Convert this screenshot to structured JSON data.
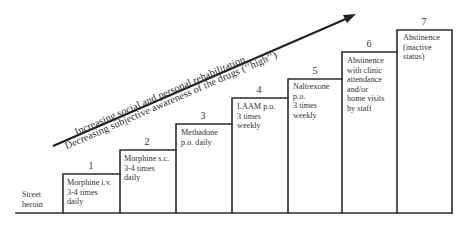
{
  "diagram": {
    "type": "staircase",
    "start_label": "Street\nheroin",
    "arrow": {
      "line1": "Increasing social and personal rehabilitation",
      "line2": "Decreasing subjective awareness of the drugs (‘‘high’’)"
    },
    "steps": [
      {
        "number": "1",
        "label": "Morphine i.v.\n3-4 times\ndaily"
      },
      {
        "number": "2",
        "label": "Morphine s.c.\n3-4 times\ndaily"
      },
      {
        "number": "3",
        "label": "Methadone\np.o. daily"
      },
      {
        "number": "4",
        "label": "LAAM p.o.\n3 times\nweekly"
      },
      {
        "number": "5",
        "label": "Naltrexone\np.o.\n3 times\nweekly"
      },
      {
        "number": "6",
        "label": "Abstinence\nwith clinic\nattendance\nand/or\nhome visits\nby staff"
      },
      {
        "number": "7",
        "label": "Abstinence\n(inactive\nstatus)"
      }
    ]
  }
}
